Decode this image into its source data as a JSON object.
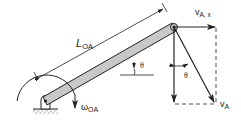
{
  "figure": {
    "type": "rigid-body kinematics diagram",
    "colors": {
      "ink": "#222222",
      "bar_fill": "#c8c8c8",
      "background": "#ffffff"
    }
  },
  "labels": {
    "length": {
      "main": "L",
      "sub": "OA"
    },
    "angle_bar": "θ",
    "angle_velocity": "θ",
    "omega": {
      "main": "ω",
      "sub": "OA"
    },
    "v_ax": {
      "main": "v",
      "sub": "A, x"
    },
    "v_a": {
      "main": "v",
      "sub": "A"
    }
  },
  "elements": {
    "pivot": "O (pinned support, ground hatch)",
    "bar": "link OA",
    "point_a": "A (tip of bar)",
    "vectors": [
      "v_A,x horizontal component",
      "vertical component",
      "v_A resultant"
    ]
  }
}
